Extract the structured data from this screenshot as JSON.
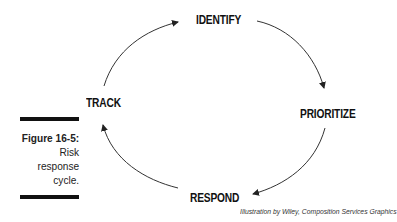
{
  "diagram": {
    "nodes": [
      {
        "id": "identify",
        "label": "IDENTIFY"
      },
      {
        "id": "prioritize",
        "label": "PRIORITIZE"
      },
      {
        "id": "respond",
        "label": "RESPOND"
      },
      {
        "id": "track",
        "label": "TRACK"
      }
    ],
    "edges": [
      {
        "from": "identify",
        "to": "prioritize"
      },
      {
        "from": "prioritize",
        "to": "respond"
      },
      {
        "from": "respond",
        "to": "track"
      },
      {
        "from": "track",
        "to": "identify"
      }
    ]
  },
  "caption": {
    "title": "Figure 16-5:",
    "line1": "Risk",
    "line2": "response",
    "line3": "cycle."
  },
  "credit": "Illustration by Wiley, Composition Services Graphics"
}
